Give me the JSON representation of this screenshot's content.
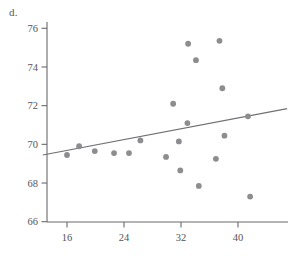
{
  "figure": {
    "panel_label": "d.",
    "dot_color": "#8d8d90",
    "line_color": "#6f6f74",
    "axis_color": "#6a6a6e",
    "text_color": "#55555a",
    "background": "#ffffff"
  },
  "chart_data": {
    "type": "scatter",
    "title": "",
    "xlabel": "",
    "ylabel": "",
    "xlim": [
      12.6,
      46.9
    ],
    "ylim": [
      65.7,
      76.9
    ],
    "xticks": [
      16,
      24,
      32,
      40
    ],
    "yticks": [
      66,
      68,
      70,
      72,
      74,
      76
    ],
    "grid": false,
    "legend": null,
    "points": [
      {
        "x": 16.0,
        "y": 69.45
      },
      {
        "x": 17.7,
        "y": 69.9
      },
      {
        "x": 19.9,
        "y": 69.65
      },
      {
        "x": 22.6,
        "y": 69.55
      },
      {
        "x": 24.7,
        "y": 69.55
      },
      {
        "x": 26.3,
        "y": 70.2
      },
      {
        "x": 29.9,
        "y": 69.35
      },
      {
        "x": 30.9,
        "y": 72.1
      },
      {
        "x": 31.7,
        "y": 70.15
      },
      {
        "x": 31.9,
        "y": 68.65
      },
      {
        "x": 32.9,
        "y": 71.1
      },
      {
        "x": 33.0,
        "y": 75.2
      },
      {
        "x": 34.1,
        "y": 74.35
      },
      {
        "x": 34.5,
        "y": 67.85
      },
      {
        "x": 36.9,
        "y": 69.25
      },
      {
        "x": 37.4,
        "y": 75.35
      },
      {
        "x": 37.8,
        "y": 72.9
      },
      {
        "x": 38.1,
        "y": 70.45
      },
      {
        "x": 41.4,
        "y": 71.45
      },
      {
        "x": 41.7,
        "y": 67.3
      }
    ],
    "fit_line": {
      "x_start": 12.6,
      "y_start": 69.45,
      "x_end": 46.9,
      "y_end": 71.85
    }
  }
}
